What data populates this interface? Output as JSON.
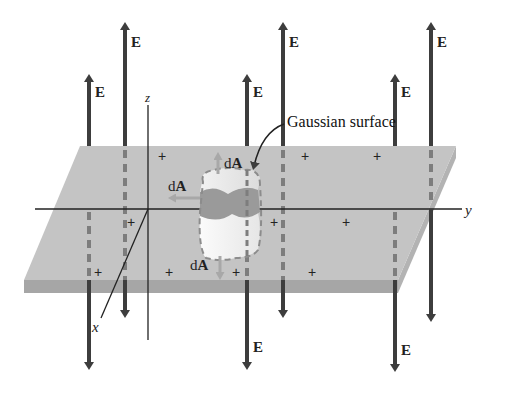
{
  "figure": {
    "labels": {
      "field": "E",
      "area_vector_prefix": "d",
      "area_vector_suffix": "A",
      "gaussian_surface": "Gaussian surface",
      "axis_x": "x",
      "axis_y": "y",
      "axis_z": "z",
      "charge": "+"
    },
    "colors": {
      "background": "#ffffff",
      "sheet_top": "#c4c4c4",
      "sheet_edge": "#a6a6a6",
      "arrow": "#3d3d3d",
      "dashed_line": "#7d7d7d",
      "cylinder_top": "#ececec",
      "cylinder_band": "#9a9a9a",
      "cylinder_bottom": "#f4f4f4",
      "area_arrow": "#a8a8a8"
    },
    "field_lines": {
      "front_row_x": [
        89,
        247,
        395
      ],
      "back_row_x": [
        125,
        283,
        431
      ]
    },
    "charges_count": 10,
    "E_labels_count": 8,
    "dA_labels_count": 3
  }
}
